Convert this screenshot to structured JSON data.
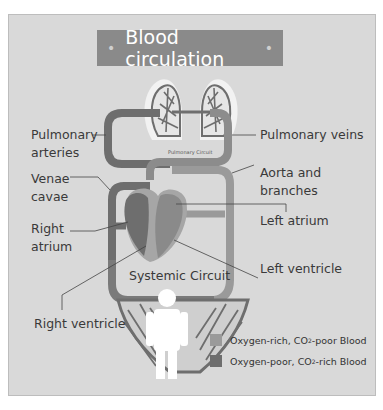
{
  "title": "Blood circulation",
  "circuits": {
    "pulmonary": "Pulmonary Circuit",
    "systemic": "Systemic Circuit"
  },
  "labels": {
    "pulmonary_arteries_1": "Pulmonary",
    "pulmonary_arteries_2": "arteries",
    "pulmonary_veins": "Pulmonary veins",
    "venae_cavae_1": "Venae",
    "venae_cavae_2": "cavae",
    "aorta_1": "Aorta and",
    "aorta_2": "branches",
    "right_atrium_1": "Right",
    "right_atrium_2": "atrium",
    "left_atrium": "Left atrium",
    "left_ventricle": "Left ventricle",
    "right_ventricle": "Right ventricle"
  },
  "legend": [
    {
      "pre": "Oxygen-rich, CO",
      "sub": "2",
      "post": "-poor Blood",
      "color": "#9a9a9a"
    },
    {
      "pre": "Oxygen-poor, CO",
      "sub": "2",
      "post": "-rich Blood",
      "color": "#6e6e6e"
    }
  ],
  "colors": {
    "panel": "#d9d9d9",
    "title_bar": "#8a8a8a",
    "oxygen_rich": "#9a9a9a",
    "oxygen_poor": "#6e6e6e",
    "lung_halo": "#f2f2f2",
    "person": "#ffffff"
  }
}
